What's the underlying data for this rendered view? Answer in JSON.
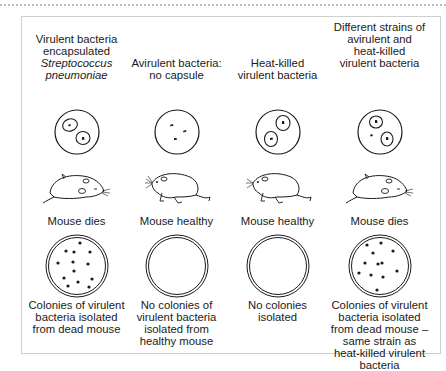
{
  "figure": {
    "type": "experiment-diagram",
    "columns": [
      {
        "id": "virulent",
        "title_lines": [
          "Virulent bacteria",
          "encapsulated"
        ],
        "title_italic_lines": [
          "Streptococcus",
          "pneumoniae"
        ],
        "tube_contents": "two encapsulated bacteria",
        "mouse_state": "dead",
        "outcome": "Mouse dies",
        "plate": "colonies",
        "result_lines": [
          "Colonies of virulent",
          "bacteria isolated",
          "from dead mouse"
        ]
      },
      {
        "id": "avirulent",
        "title_lines": [
          "Avirulent bacteria:",
          "no capsule"
        ],
        "title_italic_lines": [],
        "tube_contents": "three small uncapsulated bacteria",
        "mouse_state": "healthy",
        "outcome": "Mouse healthy",
        "plate": "empty",
        "result_lines": [
          "No colonies of",
          "virulent bacteria",
          "isolated from",
          "healthy mouse"
        ]
      },
      {
        "id": "heat-killed",
        "title_lines": [
          "Heat-killed",
          "virulent bacteria"
        ],
        "title_italic_lines": [],
        "tube_contents": "two encapsulated killed bacteria",
        "mouse_state": "healthy",
        "outcome": "Mouse healthy",
        "plate": "empty",
        "result_lines": [
          "No colonies",
          "isolated"
        ]
      },
      {
        "id": "mixed",
        "title_lines": [
          "Different strains of",
          "avirulent and",
          "heat-killed",
          "virulent bacteria"
        ],
        "title_italic_lines": [],
        "tube_contents": "two encapsulated plus one uncapsulated bacterium",
        "mouse_state": "dead",
        "outcome": "Mouse dies",
        "plate": "colonies",
        "result_lines": [
          "Colonies of virulent",
          "bacteria isolated",
          "from dead mouse –",
          "same strain as",
          "heat-killed virulent",
          "bacteria"
        ]
      }
    ]
  },
  "colors": {
    "line": "#1a1a1a",
    "frame": "#cfcfcf",
    "dotted_rule": "#b8bcc4"
  }
}
